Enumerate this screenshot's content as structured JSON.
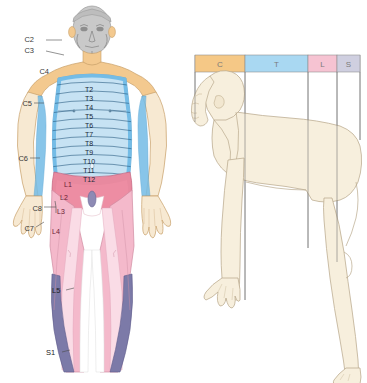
{
  "figure": {
    "panels": [
      {
        "name": "anterior-dermatome-figure",
        "caption": ""
      },
      {
        "name": "lateral-quadruped-figure",
        "caption": ""
      }
    ]
  },
  "legend": {
    "name": "spinal-region-legend",
    "segments": [
      {
        "code": "C",
        "label": "C",
        "color": "#f5c886",
        "x": 195,
        "width": 50
      },
      {
        "code": "T",
        "label": "T",
        "color": "#a9d8f2",
        "x": 245,
        "width": 63
      },
      {
        "code": "L",
        "label": "L",
        "color": "#f6c3d2",
        "x": 308,
        "width": 29
      },
      {
        "code": "S",
        "label": "S",
        "color": "#cfcfe0",
        "x": 337,
        "width": 23
      }
    ]
  },
  "labels": {
    "cervical": [
      {
        "code": "C2",
        "x": 34,
        "y": 42
      },
      {
        "code": "C3",
        "x": 34,
        "y": 53
      },
      {
        "code": "C4",
        "x": 49,
        "y": 72
      },
      {
        "code": "C5",
        "x": 26,
        "y": 105
      },
      {
        "code": "C6",
        "x": 20,
        "y": 160
      },
      {
        "code": "C7",
        "x": 25,
        "y": 230
      },
      {
        "code": "C8",
        "x": 45,
        "y": 209
      }
    ],
    "thoracic": [
      {
        "code": "T2",
        "x": 89,
        "y": 90
      },
      {
        "code": "T3",
        "x": 89,
        "y": 99
      },
      {
        "code": "T4",
        "x": 89,
        "y": 109
      },
      {
        "code": "T5",
        "x": 89,
        "y": 118
      },
      {
        "code": "T6",
        "x": 89,
        "y": 127
      },
      {
        "code": "T7",
        "x": 89,
        "y": 136
      },
      {
        "code": "T8",
        "x": 89,
        "y": 145
      },
      {
        "code": "T9",
        "x": 89,
        "y": 154
      },
      {
        "code": "T10",
        "x": 89,
        "y": 163
      },
      {
        "code": "T11",
        "x": 89,
        "y": 172
      },
      {
        "code": "T12",
        "x": 89,
        "y": 181
      }
    ],
    "lumbosacral": [
      {
        "code": "L1",
        "x": 71,
        "y": 185
      },
      {
        "code": "L2",
        "x": 66,
        "y": 198
      },
      {
        "code": "L3",
        "x": 63,
        "y": 212
      },
      {
        "code": "L4",
        "x": 58,
        "y": 232
      },
      {
        "code": "L5",
        "x": 57,
        "y": 291
      },
      {
        "code": "S1",
        "x": 52,
        "y": 353
      }
    ]
  },
  "colors": {
    "cervical_orange": "#f3c98f",
    "cervical_gray": "#c9c9c9",
    "thoracic_blue": "#74bce6",
    "thoracic_light_blue": "#c6e2f3",
    "lumbar_rose": "#e8899f",
    "lumbar_pink": "#f4b9cb",
    "lumbar_pale": "#fadce6",
    "sacral_purple": "#7c7aa8",
    "skin": "#f7e9d2",
    "lateral_skin": "#f7efdd",
    "outline": "#b9a98d"
  }
}
